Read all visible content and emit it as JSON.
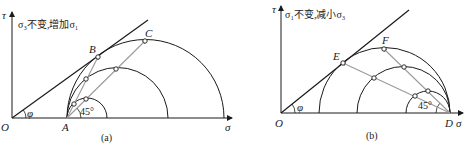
{
  "panels": [
    {
      "id": "a",
      "caption": "(a)",
      "note": "σ₃不变,增加σ₁",
      "axis": {
        "x_label": "σ",
        "y_label": "τ",
        "origin_label": "O"
      },
      "friction_angle_label": "φ",
      "angle_label": "45°",
      "points": {
        "A": "A",
        "B": "B",
        "C": "C"
      },
      "description": "σ3 held constant, σ1 increased: circles grow from fixed left point A until tangent to failure envelope at B"
    },
    {
      "id": "b",
      "caption": "(b)",
      "note": "σ₁不变,减小σ₃",
      "axis": {
        "x_label": "σ",
        "y_label": "τ",
        "origin_label": "O"
      },
      "friction_angle_label": "φ",
      "angle_label": "45°",
      "points": {
        "D": "D",
        "E": "E",
        "F": "F"
      },
      "description": "σ1 held constant, σ3 decreased: circles grow from fixed right point D until tangent to failure envelope at E"
    }
  ],
  "colors": {
    "line": "#1a1a1a",
    "path": "#9a9a9a",
    "marker_fill": "#ffffff"
  }
}
